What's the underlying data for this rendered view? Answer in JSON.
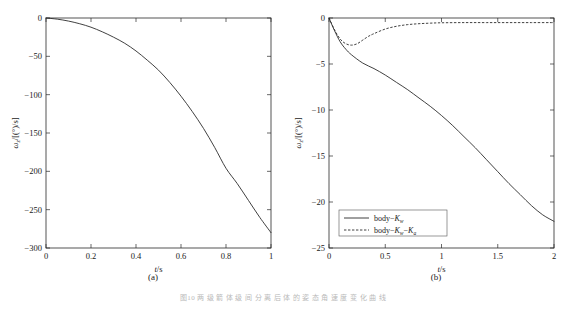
{
  "figure": {
    "caption": "图10  两  级  箭  体  级  间  分  离  后  体  的  姿  态  角  速  度  变  化  曲  线",
    "panels": [
      {
        "key": "a",
        "sublabel": "(a)"
      },
      {
        "key": "b",
        "sublabel": "(b)"
      }
    ]
  },
  "chart_data": [
    {
      "type": "line",
      "panel": "(a)",
      "title": "",
      "xlabel": "t/s",
      "ylabel": "ωz/[(°)/s]",
      "xlim": [
        0,
        1
      ],
      "ylim": [
        -300,
        0
      ],
      "xticks": [
        "0",
        "0.2",
        "0.4",
        "0.6",
        "0.8",
        "1"
      ],
      "xtick_values": [
        0,
        0.2,
        0.4,
        0.6,
        0.8,
        1
      ],
      "yticks": [
        "0",
        "-50",
        "-100",
        "-150",
        "-200",
        "-250",
        "-300"
      ],
      "ytick_values": [
        0,
        -50,
        -100,
        -150,
        -200,
        -250,
        -300
      ],
      "grid": false,
      "legend": null,
      "series": [
        {
          "name": "omega-z",
          "style": "solid",
          "x": [
            0,
            0.05,
            0.1,
            0.15,
            0.2,
            0.25,
            0.3,
            0.35,
            0.4,
            0.45,
            0.5,
            0.55,
            0.6,
            0.65,
            0.7,
            0.75,
            0.8,
            0.85,
            0.9,
            0.95,
            1.0
          ],
          "values": [
            0,
            -1.5,
            -4,
            -7.5,
            -12,
            -18,
            -25,
            -33,
            -43,
            -55,
            -68,
            -84,
            -102,
            -122,
            -144,
            -169,
            -196,
            -216,
            -238,
            -260,
            -280
          ]
        }
      ]
    },
    {
      "type": "line",
      "panel": "(b)",
      "title": "",
      "xlabel": "t/s",
      "ylabel": "ωz/[(°)/s]",
      "xlim": [
        0,
        2
      ],
      "ylim": [
        -25,
        0
      ],
      "xticks": [
        "0",
        "0.5",
        "1",
        "1.5",
        "2"
      ],
      "xtick_values": [
        0,
        0.5,
        1,
        1.5,
        2
      ],
      "yticks": [
        "0",
        "-5",
        "-10",
        "-15",
        "-20",
        "-25"
      ],
      "ytick_values": [
        0,
        -5,
        -10,
        -15,
        -20,
        -25
      ],
      "grid": false,
      "legend_position": "lower-left",
      "legend": [
        {
          "label": "body−Kw",
          "label_display": "body−K",
          "sub": "w",
          "style": "solid"
        },
        {
          "label": "body−Kw−Ka",
          "label_display": "body−K",
          "sub": "w",
          "label_display2": "−K",
          "sub2": "a",
          "style": "dashed"
        }
      ],
      "series": [
        {
          "name": "body−Kw",
          "style": "solid",
          "x": [
            0,
            0.05,
            0.1,
            0.15,
            0.2,
            0.3,
            0.4,
            0.5,
            0.6,
            0.7,
            0.8,
            0.9,
            1.0,
            1.1,
            1.2,
            1.3,
            1.4,
            1.5,
            1.6,
            1.7,
            1.8,
            1.9,
            2.0
          ],
          "values": [
            0,
            -1.4,
            -2.6,
            -3.4,
            -4.0,
            -4.9,
            -5.5,
            -6.2,
            -7.0,
            -7.8,
            -8.7,
            -9.6,
            -10.6,
            -11.7,
            -12.9,
            -14.1,
            -15.4,
            -16.7,
            -18.0,
            -19.2,
            -20.4,
            -21.4,
            -22.1
          ]
        },
        {
          "name": "body−Kw−Ka",
          "style": "dashed",
          "x": [
            0,
            0.05,
            0.1,
            0.15,
            0.2,
            0.25,
            0.3,
            0.35,
            0.4,
            0.5,
            0.6,
            0.7,
            0.8,
            0.9,
            1.0,
            1.2,
            1.4,
            1.6,
            1.8,
            2.0
          ],
          "values": [
            0,
            -1.3,
            -2.3,
            -2.8,
            -2.95,
            -2.8,
            -2.4,
            -2.0,
            -1.7,
            -1.2,
            -0.9,
            -0.72,
            -0.62,
            -0.56,
            -0.52,
            -0.5,
            -0.5,
            -0.5,
            -0.5,
            -0.5
          ]
        }
      ]
    }
  ]
}
